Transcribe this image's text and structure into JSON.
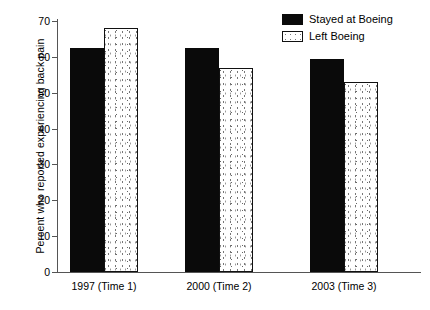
{
  "chart_data": {
    "type": "bar",
    "title": "",
    "xlabel": "",
    "ylabel": "Percent who reported experiencing back pain",
    "categories": [
      "1997 (Time 1)",
      "2000 (Time 2)",
      "2003 (Time 3)"
    ],
    "series": [
      {
        "name": "Stayed at Boeing",
        "values": [
          62.5,
          62.5,
          59.5
        ],
        "fill": "solid-black",
        "color": "#0a0a0a"
      },
      {
        "name": "Left Boeing",
        "values": [
          68,
          57,
          53
        ],
        "fill": "dotted-white",
        "color": "#ffffff"
      }
    ],
    "ylim": [
      0,
      70
    ],
    "ytick_labels": [
      "0",
      "10",
      "20",
      "30",
      "40",
      "50",
      "60",
      "70"
    ],
    "ytick_values": [
      0,
      10,
      20,
      30,
      40,
      50,
      60,
      70
    ],
    "grid": false,
    "legend_position": "top-right"
  },
  "legend": {
    "items": [
      {
        "label": "Stayed at Boeing"
      },
      {
        "label": "Left Boeing"
      }
    ]
  },
  "axis": {
    "y_title": "Percent who reported experiencing back pain"
  }
}
